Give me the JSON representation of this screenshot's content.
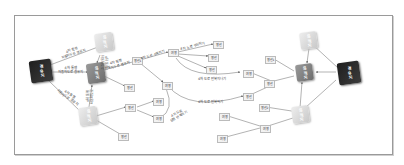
{
  "diagram": {
    "left_hub": {
      "label": "경유지",
      "color": "#2a2a2a"
    },
    "right_hub": {
      "label": "경유지",
      "color": "#2a2a2a"
    },
    "left_nodes": [
      {
        "id": "L1",
        "label": "목적지"
      },
      {
        "id": "L2",
        "label": "목적지"
      },
      {
        "id": "L3",
        "label": "목적지"
      }
    ],
    "right_nodes": [
      {
        "id": "R1",
        "label": "목적지"
      },
      {
        "id": "R2",
        "label": "목적지"
      },
      {
        "id": "R3",
        "label": "목적지"
      }
    ],
    "small_nodes": [
      {
        "id": "s1",
        "label": "행선"
      },
      {
        "id": "s2",
        "label": "행선"
      },
      {
        "id": "s3",
        "label": "행선1"
      },
      {
        "id": "s4",
        "label": "행선"
      },
      {
        "id": "s5",
        "label": "여행"
      },
      {
        "id": "s6",
        "label": "여행"
      },
      {
        "id": "s7",
        "label": "행선"
      },
      {
        "id": "s8",
        "label": "행선"
      },
      {
        "id": "s9",
        "label": "행선"
      },
      {
        "id": "s10",
        "label": "여행"
      },
      {
        "id": "s11",
        "label": "여행"
      },
      {
        "id": "s12",
        "label": "여행"
      },
      {
        "id": "s13",
        "label": "여행"
      },
      {
        "id": "s14",
        "label": "행선"
      },
      {
        "id": "s15",
        "label": "행선"
      },
      {
        "id": "s16",
        "label": "행선1"
      },
      {
        "id": "s17",
        "label": "행선2"
      },
      {
        "id": "s18",
        "label": "여행"
      },
      {
        "id": "s19",
        "label": "여행"
      }
    ],
    "edge_labels": [
      {
        "id": "e1",
        "text": "4차 통행\n자동차도로 경유지"
      },
      {
        "id": "e2",
        "text": "4차 통행\n자동차도로 경유지"
      },
      {
        "id": "e3",
        "text": "4차 통행\n자동차도로 경유지"
      },
      {
        "id": "e4",
        "text": "4차 통행\n자동차도로"
      },
      {
        "id": "e5",
        "text": "4차 통행\n자동차도로"
      },
      {
        "id": "e6",
        "text": "4차 통행\n자동차도로 경유지"
      },
      {
        "id": "e7",
        "text": "4차 도로 수목리기"
      },
      {
        "id": "e8",
        "text": "4차 도로 구심하기"
      },
      {
        "id": "e9",
        "text": "4차 도로 반복지나기"
      },
      {
        "id": "e10",
        "text": "4차 도로 반복하기"
      },
      {
        "id": "e11",
        "text": "4차 도로\n상행 반복하기"
      }
    ]
  }
}
